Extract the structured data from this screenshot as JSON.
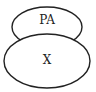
{
  "diagram": {
    "nodes": [
      {
        "id": "pa",
        "label": "PA",
        "shape": "ellipse",
        "cx": 47,
        "cy": 27,
        "rx": 35,
        "ry": 20
      },
      {
        "id": "x",
        "label": "X",
        "shape": "ellipse",
        "cx": 47,
        "cy": 61,
        "rx": 43,
        "ry": 27
      }
    ],
    "stroke_color": "#222222",
    "fill_color": "#ffffff"
  }
}
